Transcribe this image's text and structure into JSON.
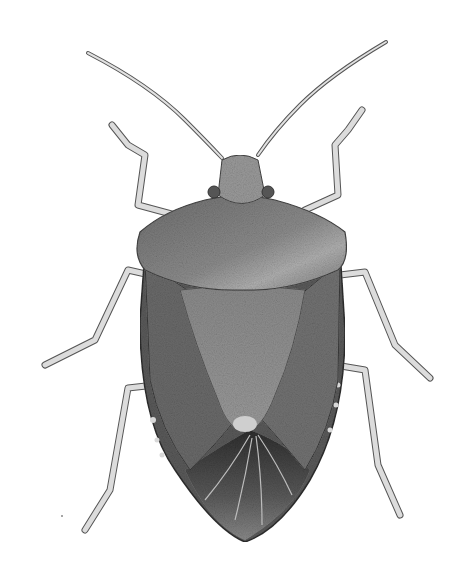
{
  "image": {
    "subject": "stink bug illustration (dorsal view)",
    "style": "grayscale stippled pencil drawing",
    "background": "#ffffff",
    "colors": {
      "body_dark": "#4a4a4a",
      "body_mid": "#7a7a7a",
      "body_light": "#b8b8b8",
      "leg": "#d6d6d6",
      "outline": "#333333"
    }
  }
}
